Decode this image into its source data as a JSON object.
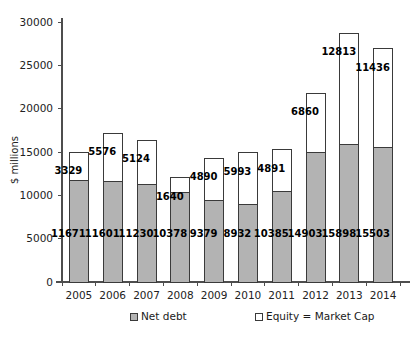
{
  "chart_data": {
    "type": "bar",
    "stacked": true,
    "title": "",
    "subtitle": "",
    "xlabel": "",
    "ylabel": "$ millions",
    "categories": [
      "2005",
      "2006",
      "2007",
      "2008",
      "2009",
      "2010",
      "2011",
      "2012",
      "2013",
      "2014"
    ],
    "ylim": [
      0,
      30000
    ],
    "yticks": [
      0,
      5000,
      10000,
      15000,
      20000,
      25000,
      30000
    ],
    "ytick_labels": [
      "0",
      "5000",
      "10000",
      "15000",
      "20000",
      "25000",
      "30000"
    ],
    "grid": false,
    "legend_position": "bottom",
    "series": [
      {
        "name": "Net debt",
        "color": "#b3b3b3",
        "edge_color": "#3a3a3a",
        "values": [
          11671,
          11601,
          11230,
          10378,
          9379,
          8932,
          10385,
          14903,
          15898,
          15503
        ],
        "labels": [
          "11671",
          "11601",
          "11230",
          "10378",
          "9379",
          "8932",
          "10385",
          "14903",
          "15898",
          "15503"
        ]
      },
      {
        "name": "Equity = Market Cap",
        "color": "#ffffff",
        "edge_color": "#3a3a3a",
        "values": [
          3329,
          5576,
          5124,
          1640,
          4890,
          5993,
          4891,
          6860,
          12813,
          11436
        ],
        "labels": [
          "3329",
          "5576",
          "5124",
          "1640",
          "4890",
          "5993",
          "4891",
          "6860",
          "12813",
          "11436"
        ]
      }
    ],
    "totals": [
      15000,
      17177,
      16354,
      12018,
      14269,
      14925,
      15276,
      21763,
      28711,
      26939
    ]
  },
  "legend": {
    "items": [
      {
        "label": "Net debt",
        "swatch": "#b3b3b3"
      },
      {
        "label": "Equity = Market Cap",
        "swatch": "#ffffff"
      }
    ]
  }
}
